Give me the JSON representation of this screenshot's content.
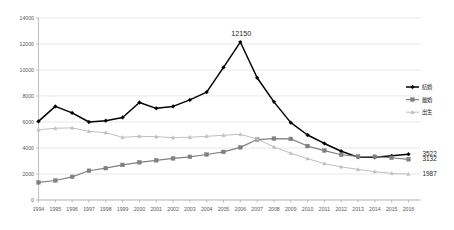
{
  "chart_data": {
    "type": "line",
    "title": "",
    "subtitle": "",
    "xlabel": "",
    "ylabel": "",
    "grid": true,
    "legend_position": "right",
    "ylim": [
      0,
      14000
    ],
    "ytick_labels": [
      "14000",
      "12000",
      "10000",
      "8000",
      "6000",
      "4000",
      "2000",
      "0"
    ],
    "ytick_values": [
      14000,
      12000,
      10000,
      8000,
      6000,
      4000,
      2000,
      0
    ],
    "categories": [
      "1994",
      "1995",
      "1996",
      "1997",
      "1998",
      "1999",
      "2000",
      "2001",
      "2002",
      "2003",
      "2004",
      "2005",
      "2006",
      "2007",
      "2008",
      "2009",
      "2010",
      "2011",
      "2012",
      "2013",
      "2014",
      "2015",
      "2016"
    ],
    "series": [
      {
        "name": "結婚",
        "color": "#000000",
        "marker": "diamond",
        "values": [
          6050,
          7200,
          6700,
          6000,
          6100,
          6350,
          7500,
          7050,
          7200,
          7700,
          8300,
          10200,
          12150,
          9400,
          7550,
          5950,
          5000,
          4350,
          3750,
          3300,
          3280,
          3400,
          3522
        ]
      },
      {
        "name": "離婚",
        "color": "#808080",
        "marker": "square",
        "values": [
          1350,
          1500,
          1780,
          2250,
          2450,
          2700,
          2900,
          3050,
          3200,
          3320,
          3500,
          3700,
          4050,
          4650,
          4720,
          4700,
          4150,
          3800,
          3480,
          3350,
          3330,
          3250,
          3132
        ]
      },
      {
        "name": "出生",
        "color": "#bfbfbf",
        "marker": "triangle",
        "values": [
          5400,
          5520,
          5550,
          5280,
          5180,
          4820,
          4900,
          4870,
          4800,
          4830,
          4900,
          4980,
          5050,
          4700,
          4080,
          3600,
          3180,
          2800,
          2550,
          2350,
          2180,
          2050,
          1987
        ]
      }
    ],
    "annotations": [
      {
        "text": "12150",
        "series": "結婚",
        "category": "2006",
        "value": 12150
      }
    ],
    "end_labels": [
      {
        "text": "3522",
        "series": "結婚",
        "value": 3522
      },
      {
        "text": "3132",
        "series": "離婚",
        "value": 3132
      },
      {
        "text": "1987",
        "series": "出生",
        "value": 1987
      }
    ]
  }
}
